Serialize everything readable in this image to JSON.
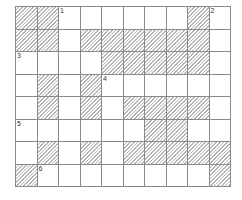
{
  "puzzle": {
    "type": "crossword",
    "rows": 8,
    "cols": 10,
    "grid": [
      "##._____#.",
      "##.######.",
      "....#####.",
      ".#.#......",
      ".#.#.####.",
      "......##..",
      ".#.#.#####",
      "#........#"
    ],
    "numbers": [
      {
        "row": 0,
        "col": 2,
        "label": "1"
      },
      {
        "row": 0,
        "col": 9,
        "label": "2"
      },
      {
        "row": 2,
        "col": 0,
        "label": "3"
      },
      {
        "row": 3,
        "col": 4,
        "label": "4"
      },
      {
        "row": 5,
        "col": 0,
        "label": "5"
      },
      {
        "row": 7,
        "col": 1,
        "label": "6"
      }
    ]
  },
  "colors": {
    "grid_line": "#8a8a8a",
    "shade": "#b5b5b5",
    "background": "#ffffff"
  }
}
